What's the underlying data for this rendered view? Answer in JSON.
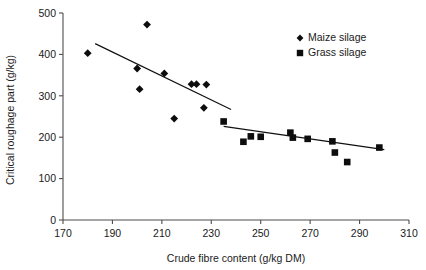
{
  "chart_data": {
    "type": "scatter",
    "title": "",
    "xlabel": "Crude fibre content (g/kg DM)",
    "ylabel": "Critical roughage part (g/kg)",
    "xlim": [
      170,
      310
    ],
    "ylim": [
      0,
      500
    ],
    "xticks": [
      170,
      190,
      210,
      230,
      250,
      270,
      290,
      310
    ],
    "yticks": [
      0,
      100,
      200,
      300,
      400,
      500
    ],
    "xtick_labels": [
      "170",
      "190",
      "210",
      "230",
      "250",
      "270",
      "290",
      "310"
    ],
    "ytick_labels": [
      "0",
      "100",
      "200",
      "300",
      "400",
      "500"
    ],
    "grid": false,
    "legend_position": "top-right",
    "series": [
      {
        "name": "Maize silage",
        "marker": "diamond",
        "color": "#0d0d0d",
        "points": [
          {
            "x": 180,
            "y": 403
          },
          {
            "x": 204,
            "y": 472
          },
          {
            "x": 200,
            "y": 366
          },
          {
            "x": 201,
            "y": 316
          },
          {
            "x": 211,
            "y": 354
          },
          {
            "x": 215,
            "y": 245
          },
          {
            "x": 222,
            "y": 328
          },
          {
            "x": 224,
            "y": 328
          },
          {
            "x": 228,
            "y": 327
          },
          {
            "x": 227,
            "y": 271
          }
        ],
        "trendline": {
          "x1": 183,
          "y1": 426,
          "x2": 238,
          "y2": 267
        }
      },
      {
        "name": "Grass silage",
        "marker": "square",
        "color": "#0d0d0d",
        "points": [
          {
            "x": 235,
            "y": 238
          },
          {
            "x": 243,
            "y": 189
          },
          {
            "x": 246,
            "y": 202
          },
          {
            "x": 250,
            "y": 201
          },
          {
            "x": 262,
            "y": 211
          },
          {
            "x": 263,
            "y": 199
          },
          {
            "x": 269,
            "y": 196
          },
          {
            "x": 279,
            "y": 190
          },
          {
            "x": 280,
            "y": 163
          },
          {
            "x": 285,
            "y": 140
          },
          {
            "x": 298,
            "y": 175
          }
        ],
        "trendline": {
          "x1": 235,
          "y1": 226,
          "x2": 300,
          "y2": 170
        }
      }
    ]
  },
  "legend": {
    "items": [
      {
        "label": "Maize silage",
        "marker": "diamond"
      },
      {
        "label": "Grass silage",
        "marker": "square"
      }
    ]
  }
}
